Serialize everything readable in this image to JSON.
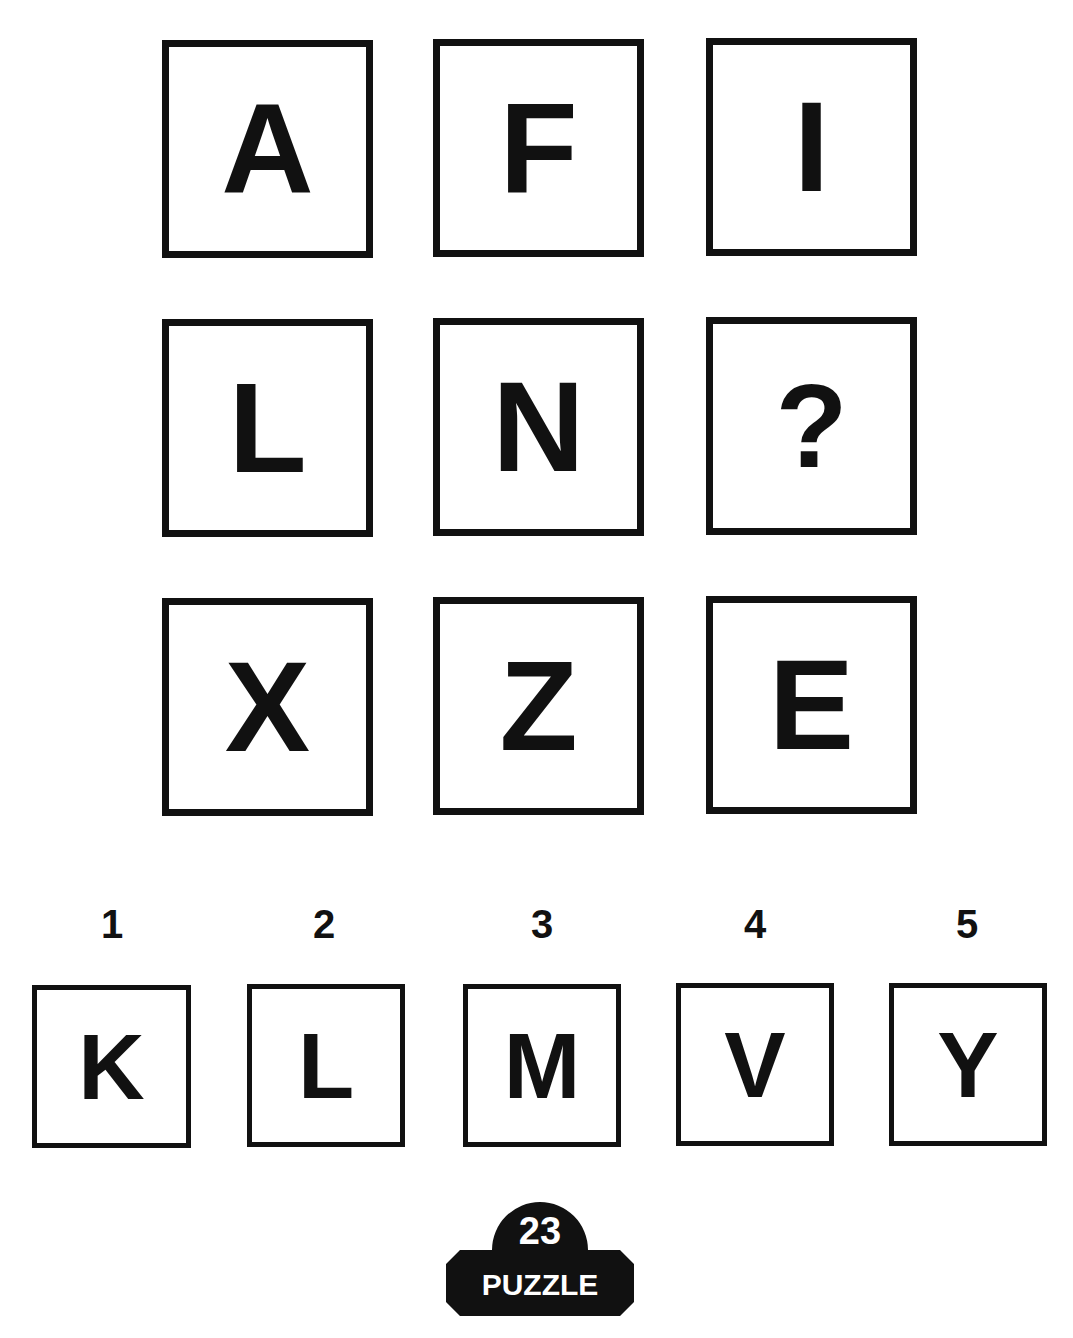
{
  "grid": {
    "cells": [
      {
        "row": 1,
        "col": 1,
        "value": "A"
      },
      {
        "row": 1,
        "col": 2,
        "value": "F"
      },
      {
        "row": 1,
        "col": 3,
        "value": "I"
      },
      {
        "row": 2,
        "col": 1,
        "value": "L"
      },
      {
        "row": 2,
        "col": 2,
        "value": "N"
      },
      {
        "row": 2,
        "col": 3,
        "value": "?"
      },
      {
        "row": 3,
        "col": 1,
        "value": "X"
      },
      {
        "row": 3,
        "col": 2,
        "value": "Z"
      },
      {
        "row": 3,
        "col": 3,
        "value": "E"
      }
    ]
  },
  "options": [
    {
      "number": "1",
      "value": "K"
    },
    {
      "number": "2",
      "value": "L"
    },
    {
      "number": "3",
      "value": "M"
    },
    {
      "number": "4",
      "value": "V"
    },
    {
      "number": "5",
      "value": "Y"
    }
  ],
  "badge": {
    "number": "23",
    "label": "PUZZLE"
  }
}
